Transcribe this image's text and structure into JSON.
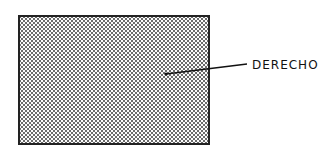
{
  "diagram": {
    "region": {
      "name": "right-side-region",
      "fill": "stippled dot pattern"
    },
    "label": "DERECHO"
  }
}
